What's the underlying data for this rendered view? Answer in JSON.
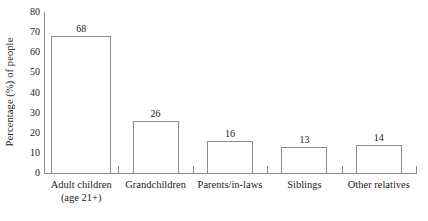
{
  "chart_data": {
    "type": "bar",
    "title": "",
    "xlabel": "",
    "ylabel": "Percentage (%) of people",
    "ylim": [
      0,
      80
    ],
    "yticks": [
      0,
      10,
      20,
      30,
      40,
      50,
      60,
      70,
      80
    ],
    "ytick_labels": [
      "0",
      "10",
      "20",
      "30",
      "40",
      "50",
      "60",
      "70",
      "80"
    ],
    "grid": false,
    "legend": null,
    "categories": [
      "Adult children (age 21+)",
      "Grandchildren",
      "Parents/in-laws",
      "Siblings",
      "Other relatives"
    ],
    "category_lines": [
      [
        "Adult children",
        "(age 21+)"
      ],
      [
        "Grandchildren",
        ""
      ],
      [
        "Parents/in-laws",
        ""
      ],
      [
        "Siblings",
        ""
      ],
      [
        "Other relatives",
        ""
      ]
    ],
    "values": [
      68,
      26,
      16,
      13,
      14
    ],
    "value_labels": [
      "68",
      "26",
      "16",
      "13",
      "14"
    ],
    "bar_fill_color": "#ffffff",
    "bar_edge_color": "#8a8a8a",
    "axis_color": "#8a8a8a",
    "text_color": "#1a1a1a",
    "background_color": "#ffffff"
  }
}
